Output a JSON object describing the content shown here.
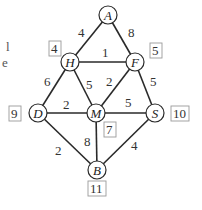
{
  "graph": {
    "nodes": [
      {
        "id": "A",
        "label": "A",
        "x": 108,
        "y": 15
      },
      {
        "id": "H",
        "label": "H",
        "x": 70,
        "y": 62
      },
      {
        "id": "F",
        "label": "F",
        "x": 135,
        "y": 62
      },
      {
        "id": "D",
        "label": "D",
        "x": 38,
        "y": 113
      },
      {
        "id": "M",
        "label": "M",
        "x": 96,
        "y": 113
      },
      {
        "id": "S",
        "label": "S",
        "x": 155,
        "y": 113
      },
      {
        "id": "B",
        "label": "B",
        "x": 97,
        "y": 170
      }
    ],
    "edges": [
      {
        "from": "A",
        "to": "H",
        "weight": "4"
      },
      {
        "from": "A",
        "to": "F",
        "weight": "8"
      },
      {
        "from": "H",
        "to": "F",
        "weight": "1"
      },
      {
        "from": "H",
        "to": "D",
        "weight": "6"
      },
      {
        "from": "H",
        "to": "M",
        "weight": "5"
      },
      {
        "from": "F",
        "to": "M",
        "weight": "2"
      },
      {
        "from": "F",
        "to": "S",
        "weight": "5"
      },
      {
        "from": "D",
        "to": "M",
        "weight": "2"
      },
      {
        "from": "M",
        "to": "S",
        "weight": "5"
      },
      {
        "from": "M",
        "to": "B",
        "weight": "8"
      },
      {
        "from": "D",
        "to": "B",
        "weight": "2"
      },
      {
        "from": "S",
        "to": "B",
        "weight": "4"
      }
    ],
    "boxed_labels": [
      {
        "node": "H",
        "value": "4"
      },
      {
        "node": "F",
        "value": "5"
      },
      {
        "node": "D",
        "value": "9"
      },
      {
        "node": "M",
        "value": "7"
      },
      {
        "node": "S",
        "value": "10"
      },
      {
        "node": "B",
        "value": "11"
      }
    ]
  },
  "clipped_text": [
    "l",
    "e"
  ]
}
